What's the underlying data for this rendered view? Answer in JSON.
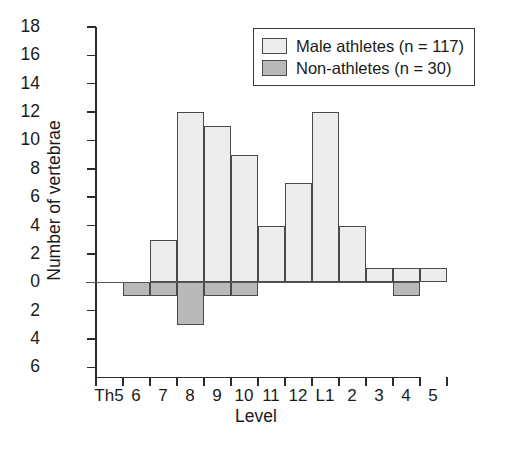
{
  "chart_data": {
    "type": "bar",
    "title": "",
    "xlabel": "Level",
    "ylabel": "Number of vertebrae",
    "categories": [
      "Th5",
      "6",
      "7",
      "8",
      "9",
      "10",
      "11",
      "12",
      "L1",
      "2",
      "3",
      "4",
      "5"
    ],
    "series": [
      {
        "name": "Male athletes (n = 117)",
        "color": "#ededed",
        "direction": "up",
        "values": [
          0,
          0,
          3,
          12,
          11,
          9,
          4,
          7,
          12,
          4,
          1,
          1,
          1
        ]
      },
      {
        "name": "Non-athletes (n = 30)",
        "color": "#b9b9b9",
        "direction": "down",
        "values": [
          0,
          1,
          1,
          3,
          1,
          1,
          0,
          0,
          0,
          0,
          0,
          1,
          0
        ]
      }
    ],
    "yticks_up": [
      0,
      2,
      4,
      6,
      8,
      10,
      12,
      14,
      16,
      18
    ],
    "yticks_down": [
      2,
      4,
      6
    ],
    "ytick_labels": [
      "18",
      "16",
      "14",
      "12",
      "10",
      "8",
      "6",
      "4",
      "2",
      "0",
      "2",
      "4",
      "6"
    ],
    "ylim": [
      -6,
      18
    ],
    "grid": false,
    "legend_position": "top-right"
  },
  "legend": {
    "entries": [
      {
        "label": "Male athletes (n = 117)",
        "swatch": "light"
      },
      {
        "label": "Non-athletes (n = 30)",
        "swatch": "dark"
      }
    ]
  },
  "axis": {
    "x_title": "Level",
    "y_title": "Number of vertebrae"
  }
}
